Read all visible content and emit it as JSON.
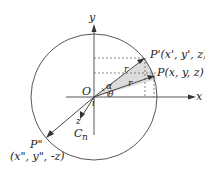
{
  "diagram": {
    "axes": {
      "x_label": "x",
      "y_label": "y",
      "z_label": "z",
      "origin_label": "O"
    },
    "points": {
      "P": "P(x, y, z)",
      "P_prime": "P'(x', y', z)",
      "P_double_prime_name": "P\"",
      "P_double_prime_coords": "(x\", y\", -z)"
    },
    "vectors": {
      "r1": "r",
      "r2": "r",
      "normal": "C",
      "normal_sub": "n",
      "unit": "i"
    },
    "angles": {
      "alpha": "α",
      "theta": "θ"
    },
    "colors": {
      "line": "#333333",
      "shade": "#dcdcdc"
    }
  }
}
